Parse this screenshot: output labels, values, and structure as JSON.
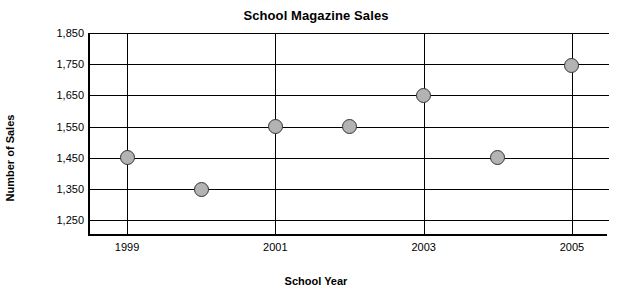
{
  "chart_data": {
    "type": "scatter",
    "title": "School Magazine Sales",
    "xlabel": "School Year",
    "ylabel": "Number of Sales",
    "x": [
      1999,
      2000,
      2001,
      2002,
      2003,
      2004,
      2005
    ],
    "values": [
      1450,
      1350,
      1550,
      1550,
      1650,
      1450,
      1745
    ],
    "xticks": [
      "1999",
      "2001",
      "2003",
      "2005"
    ],
    "xtick_values": [
      1999,
      2001,
      2003,
      2005
    ],
    "yticks": [
      "1,250",
      "1,350",
      "1,450",
      "1,550",
      "1,650",
      "1,750",
      "1,850"
    ],
    "ytick_values": [
      1250,
      1350,
      1450,
      1550,
      1650,
      1750,
      1850
    ],
    "xlim": [
      1998.5,
      2005.5
    ],
    "ylim": [
      1200,
      1850
    ],
    "grid": "horizontal-and-vertical-at-ticks",
    "legend": "none",
    "marker_fill": "#b3b3b3",
    "marker_edge": "#333333"
  }
}
